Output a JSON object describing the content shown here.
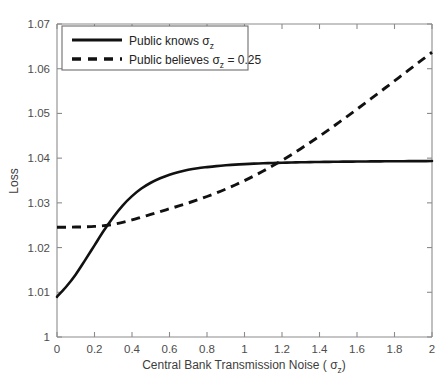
{
  "figure": {
    "width": 448,
    "height": 386,
    "background": "#ffffff",
    "line_color": "#111111",
    "axis_color": "#8c8c8c"
  },
  "chart_data": {
    "type": "line",
    "title": "",
    "xlabel": "Central Bank Transmission Noise ( σ z )",
    "xlabel_main": "Central Bank Transmission Noise ( σ",
    "xlabel_sub": "z",
    "xlabel_tail": ")",
    "ylabel": "Loss",
    "xlim": [
      0,
      2
    ],
    "ylim": [
      1,
      1.07
    ],
    "grid": false,
    "legend_position": "top-left",
    "xticks": [
      0,
      0.2,
      0.4,
      0.6,
      0.8,
      1,
      1.2,
      1.4,
      1.6,
      1.8,
      2
    ],
    "xticklabels": [
      "0",
      "0.2",
      "0.4",
      "0.6",
      "0.8",
      "1",
      "1.2",
      "1.4",
      "1.6",
      "1.8",
      "2"
    ],
    "yticks": [
      1,
      1.01,
      1.02,
      1.03,
      1.04,
      1.05,
      1.06,
      1.07
    ],
    "yticklabels": [
      "1",
      "1.01",
      "1.02",
      "1.03",
      "1.04",
      "1.05",
      "1.06",
      "1.07"
    ],
    "x": [
      0,
      0.05,
      0.1,
      0.15,
      0.2,
      0.25,
      0.3,
      0.35,
      0.4,
      0.45,
      0.5,
      0.55,
      0.6,
      0.65,
      0.7,
      0.75,
      0.8,
      0.85,
      0.9,
      0.95,
      1,
      1.05,
      1.1,
      1.15,
      1.2,
      1.25,
      1.3,
      1.35,
      1.4,
      1.45,
      1.5,
      1.55,
      1.6,
      1.65,
      1.7,
      1.75,
      1.8,
      1.85,
      1.9,
      1.95,
      2
    ],
    "series": [
      {
        "name": "Public knows σ z",
        "label_main": "Public knows  σ",
        "label_sub": "z",
        "label_tail": "",
        "style": "solid",
        "color": "#111111",
        "values": [
          1.009,
          1.0113,
          1.014,
          1.0172,
          1.0205,
          1.0238,
          1.0268,
          1.0294,
          1.0315,
          1.0332,
          1.0345,
          1.0355,
          1.0363,
          1.0369,
          1.0374,
          1.03775,
          1.038,
          1.03822,
          1.0384,
          1.03855,
          1.03867,
          1.03877,
          1.03885,
          1.03892,
          1.03898,
          1.03903,
          1.03907,
          1.03911,
          1.03914,
          1.03917,
          1.0392,
          1.03922,
          1.03924,
          1.03926,
          1.03928,
          1.03929,
          1.03931,
          1.03932,
          1.03933,
          1.03934,
          1.03935
        ]
      },
      {
        "name": "Public believes σ z = 0.25",
        "label_main": "Public believes σ",
        "label_sub": "z",
        "label_tail": " = 0.25",
        "style": "dashed",
        "color": "#111111",
        "values": [
          1.02455,
          1.02456,
          1.02459,
          1.02464,
          1.02473,
          1.0249,
          1.0252,
          1.02565,
          1.0262,
          1.0268,
          1.02742,
          1.02805,
          1.02868,
          1.02932,
          1.02998,
          1.03068,
          1.03142,
          1.03222,
          1.03308,
          1.034,
          1.03498,
          1.03602,
          1.03712,
          1.03828,
          1.0395,
          1.04078,
          1.04212,
          1.0435,
          1.04492,
          1.04638,
          1.04788,
          1.0494,
          1.05095,
          1.05252,
          1.0541,
          1.05568,
          1.05728,
          1.05888,
          1.06048,
          1.06208,
          1.06368
        ]
      }
    ],
    "annotations": {
      "crossing_point": {
        "x": 1.25,
        "y": 1.0376
      },
      "solid_start": {
        "x": 0,
        "y": 1.009
      },
      "solid_end": {
        "x": 2,
        "y": 1.038
      },
      "dashed_start": {
        "x": 0,
        "y": 1.0245
      },
      "dashed_end": {
        "x": 2,
        "y": 1.057
      }
    }
  },
  "legend": {
    "entries": [
      {
        "label_main": "Public knows  σ",
        "label_sub": "z",
        "label_tail": "",
        "style": "solid"
      },
      {
        "label_main": "Public believes σ",
        "label_sub": "z",
        "label_tail": " = 0.25",
        "style": "dashed"
      }
    ]
  }
}
